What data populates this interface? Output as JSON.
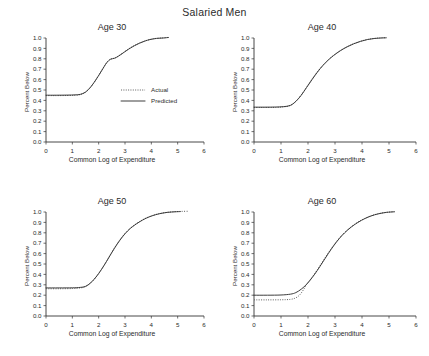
{
  "figure": {
    "title": "Salaried Men",
    "background": "#ffffff",
    "ink": "#333333"
  },
  "legend": {
    "position": "inside-panel-age-30",
    "entries": [
      {
        "label": "Actual",
        "style": "dotted",
        "color": "#555555"
      },
      {
        "label": "Predicted",
        "style": "solid",
        "color": "#333333"
      }
    ]
  },
  "chart_data": [
    {
      "type": "line",
      "title": "Age 30",
      "xlabel": "Common Log of Expenditure",
      "ylabel": "Percent Below",
      "xlim": [
        0,
        6
      ],
      "ylim": [
        0,
        1
      ],
      "xticks": [
        0,
        1,
        2,
        3,
        4,
        5,
        6
      ],
      "yticks": [
        0.0,
        0.1,
        0.2,
        0.3,
        0.4,
        0.5,
        0.6,
        0.7,
        0.8,
        0.9,
        1.0
      ],
      "ytick_labels": [
        "0.0",
        "0.1",
        "0.2",
        "0.3",
        "0.4",
        "0.5",
        "0.6",
        "0.7",
        "0.8",
        "0.9",
        "1.0"
      ],
      "grid": false,
      "series": [
        {
          "name": "Predicted",
          "style": "solid",
          "x": [
            0.0,
            0.4,
            0.8,
            1.1,
            1.3,
            1.5,
            1.7,
            1.9,
            2.1,
            2.3,
            2.45,
            2.6,
            2.75,
            2.95,
            3.15,
            3.35,
            3.55,
            3.75,
            3.95,
            4.2,
            4.45,
            4.65
          ],
          "y": [
            0.45,
            0.45,
            0.451,
            0.453,
            0.458,
            0.48,
            0.53,
            0.6,
            0.68,
            0.76,
            0.795,
            0.805,
            0.825,
            0.86,
            0.895,
            0.925,
            0.95,
            0.97,
            0.985,
            0.996,
            1.0,
            1.005
          ]
        },
        {
          "name": "Actual",
          "style": "dotted",
          "x": [
            0.0,
            0.4,
            0.8,
            1.1,
            1.3,
            1.5,
            1.7,
            1.9,
            2.1,
            2.3,
            2.45,
            2.6,
            2.75,
            2.95,
            3.15,
            3.35,
            3.55,
            3.75,
            3.95,
            4.2,
            4.45,
            4.65
          ],
          "y": [
            0.446,
            0.446,
            0.447,
            0.449,
            0.456,
            0.478,
            0.528,
            0.6,
            0.682,
            0.763,
            0.798,
            0.806,
            0.827,
            0.862,
            0.897,
            0.927,
            0.951,
            0.971,
            0.986,
            0.997,
            1.001,
            1.006
          ]
        }
      ]
    },
    {
      "type": "line",
      "title": "Age 40",
      "xlabel": "Common Log of Expenditure",
      "ylabel": "Percent Below",
      "xlim": [
        0,
        6
      ],
      "ylim": [
        0,
        1
      ],
      "xticks": [
        0,
        1,
        2,
        3,
        4,
        5,
        6
      ],
      "yticks": [
        0.0,
        0.1,
        0.2,
        0.3,
        0.4,
        0.5,
        0.6,
        0.7,
        0.8,
        0.9,
        1.0
      ],
      "ytick_labels": [
        "0.0",
        "0.1",
        "0.2",
        "0.3",
        "0.4",
        "0.5",
        "0.6",
        "0.7",
        "0.8",
        "0.9",
        "1.0"
      ],
      "grid": false,
      "series": [
        {
          "name": "Predicted",
          "style": "solid",
          "x": [
            0.0,
            0.4,
            0.8,
            1.1,
            1.35,
            1.55,
            1.75,
            1.95,
            2.15,
            2.35,
            2.55,
            2.75,
            2.95,
            3.2,
            3.45,
            3.7,
            3.95,
            4.2,
            4.45,
            4.7,
            4.9
          ],
          "y": [
            0.335,
            0.335,
            0.336,
            0.34,
            0.352,
            0.39,
            0.45,
            0.525,
            0.6,
            0.672,
            0.735,
            0.788,
            0.832,
            0.878,
            0.915,
            0.945,
            0.968,
            0.985,
            0.995,
            1.0,
            1.002
          ]
        },
        {
          "name": "Actual",
          "style": "dotted",
          "x": [
            0.0,
            0.4,
            0.8,
            1.1,
            1.35,
            1.55,
            1.75,
            1.95,
            2.15,
            2.35,
            2.55,
            2.75,
            2.95,
            3.2,
            3.45,
            3.7,
            3.95,
            4.2,
            4.45,
            4.7,
            4.9
          ],
          "y": [
            0.332,
            0.332,
            0.333,
            0.338,
            0.352,
            0.392,
            0.452,
            0.528,
            0.606,
            0.676,
            0.738,
            0.79,
            0.834,
            0.88,
            0.917,
            0.946,
            0.969,
            0.986,
            0.996,
            1.001,
            1.003
          ]
        }
      ]
    },
    {
      "type": "line",
      "title": "Age 50",
      "xlabel": "Common Log of Expenditure",
      "ylabel": "Percent Below",
      "xlim": [
        0,
        6
      ],
      "ylim": [
        0,
        1
      ],
      "xticks": [
        0,
        1,
        2,
        3,
        4,
        5,
        6
      ],
      "yticks": [
        0.0,
        0.1,
        0.2,
        0.3,
        0.4,
        0.5,
        0.6,
        0.7,
        0.8,
        0.9,
        1.0
      ],
      "ytick_labels": [
        "0.0",
        "0.1",
        "0.2",
        "0.3",
        "0.4",
        "0.5",
        "0.6",
        "0.7",
        "0.8",
        "0.9",
        "1.0"
      ],
      "grid": false,
      "series": [
        {
          "name": "Predicted",
          "style": "solid",
          "x": [
            0.0,
            0.5,
            1.0,
            1.3,
            1.5,
            1.7,
            1.9,
            2.1,
            2.3,
            2.5,
            2.7,
            2.9,
            3.1,
            3.3,
            3.55,
            3.8,
            4.05,
            4.3,
            4.6,
            4.9,
            5.1
          ],
          "y": [
            0.27,
            0.27,
            0.271,
            0.275,
            0.285,
            0.32,
            0.375,
            0.445,
            0.525,
            0.61,
            0.69,
            0.76,
            0.818,
            0.862,
            0.905,
            0.94,
            0.965,
            0.983,
            0.996,
            1.002,
            1.004
          ]
        },
        {
          "name": "Actual",
          "style": "dotted",
          "x": [
            0.0,
            0.5,
            1.0,
            1.3,
            1.5,
            1.7,
            1.9,
            2.1,
            2.3,
            2.5,
            2.7,
            2.9,
            3.1,
            3.3,
            3.55,
            3.8,
            4.05,
            4.3,
            4.6,
            4.9,
            5.15,
            5.4
          ],
          "y": [
            0.262,
            0.262,
            0.264,
            0.27,
            0.282,
            0.318,
            0.374,
            0.446,
            0.528,
            0.614,
            0.694,
            0.764,
            0.82,
            0.864,
            0.907,
            0.942,
            0.967,
            0.984,
            0.997,
            1.003,
            1.006,
            1.007
          ]
        }
      ]
    },
    {
      "type": "line",
      "title": "Age 60",
      "xlabel": "Common Log of Expenditure",
      "ylabel": "Percent Below",
      "xlim": [
        0,
        6
      ],
      "ylim": [
        0,
        1
      ],
      "xticks": [
        0,
        1,
        2,
        3,
        4,
        5,
        6
      ],
      "yticks": [
        0.0,
        0.1,
        0.2,
        0.3,
        0.4,
        0.5,
        0.6,
        0.7,
        0.8,
        0.9,
        1.0
      ],
      "ytick_labels": [
        "0.0",
        "0.1",
        "0.2",
        "0.3",
        "0.4",
        "0.5",
        "0.6",
        "0.7",
        "0.8",
        "0.9",
        "1.0"
      ],
      "grid": false,
      "notes": "Actual (dotted) sits below Predicted in the flat region, rejoining near x=1.8",
      "series": [
        {
          "name": "Predicted",
          "style": "solid",
          "x": [
            0.0,
            0.5,
            1.0,
            1.35,
            1.55,
            1.75,
            1.95,
            2.15,
            2.35,
            2.55,
            2.75,
            2.95,
            3.15,
            3.35,
            3.6,
            3.85,
            4.1,
            4.35,
            4.6,
            4.9,
            5.2
          ],
          "y": [
            0.2,
            0.2,
            0.202,
            0.21,
            0.225,
            0.258,
            0.305,
            0.368,
            0.44,
            0.52,
            0.6,
            0.675,
            0.742,
            0.798,
            0.855,
            0.9,
            0.936,
            0.963,
            0.982,
            0.996,
            1.002
          ]
        },
        {
          "name": "Actual",
          "style": "dotted",
          "x": [
            0.0,
            0.5,
            1.0,
            1.35,
            1.55,
            1.7,
            1.85,
            1.95,
            2.15,
            2.35,
            2.55,
            2.75,
            2.95,
            3.15,
            3.35,
            3.6,
            3.85,
            4.1,
            4.35,
            4.6,
            4.9,
            5.2
          ],
          "y": [
            0.155,
            0.155,
            0.156,
            0.16,
            0.175,
            0.205,
            0.26,
            0.305,
            0.372,
            0.446,
            0.526,
            0.606,
            0.68,
            0.746,
            0.802,
            0.858,
            0.903,
            0.938,
            0.965,
            0.983,
            0.997,
            1.003
          ]
        }
      ]
    }
  ]
}
